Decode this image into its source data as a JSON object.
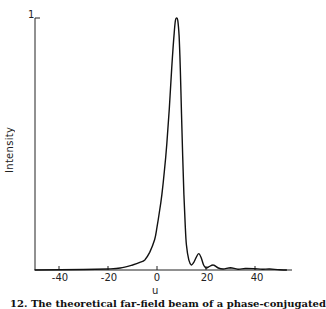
{
  "chart_data": {
    "type": "line",
    "title": "",
    "xlabel": "u",
    "ylabel": "Intensity",
    "xlim": [
      -50,
      55
    ],
    "ylim": [
      0,
      1
    ],
    "xticks": [
      -40,
      -20,
      0,
      20,
      40
    ],
    "xtick_labels": [
      "-40",
      "-20",
      "0",
      "20",
      "40"
    ],
    "yticks": [
      1
    ],
    "ytick_labels": [
      "1"
    ],
    "grid": false,
    "legend": null,
    "series": [
      {
        "name": "Intensity",
        "x": [
          -50,
          -30,
          -20,
          -15,
          -10,
          -7,
          -5,
          -3,
          -1,
          0,
          1,
          2,
          3,
          4,
          5,
          6,
          7,
          7.5,
          8,
          8.5,
          9,
          9.5,
          10,
          10.5,
          11,
          11.5,
          12,
          13,
          14,
          15,
          16,
          17,
          18,
          19,
          20,
          21,
          23,
          25,
          27,
          30,
          33,
          36,
          40,
          43,
          46,
          50,
          53
        ],
        "values": [
          0,
          0.002,
          0.004,
          0.008,
          0.02,
          0.03,
          0.04,
          0.07,
          0.12,
          0.17,
          0.23,
          0.3,
          0.39,
          0.5,
          0.64,
          0.8,
          0.94,
          0.99,
          1.0,
          0.99,
          0.93,
          0.8,
          0.62,
          0.45,
          0.3,
          0.18,
          0.1,
          0.04,
          0.02,
          0.03,
          0.05,
          0.065,
          0.05,
          0.02,
          0.008,
          0.012,
          0.02,
          0.008,
          0.004,
          0.009,
          0.003,
          0.006,
          0.005,
          0.003,
          0.004,
          0.001,
          0
        ]
      }
    ]
  },
  "axes": {
    "ylabel": "Intensity",
    "xlabel": "u",
    "ytick_top": "1",
    "xticks": [
      "-40",
      "-20",
      "0",
      "20",
      "40"
    ]
  },
  "caption": "12.  The theoretical far-field beam of a phase-conjugated"
}
